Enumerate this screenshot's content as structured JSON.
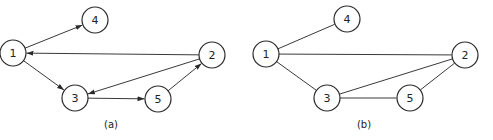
{
  "diagrams": [
    {
      "id": "a",
      "caption": "(a)",
      "caption_pos": [
        111,
        124
      ],
      "directed": true,
      "nodes": [
        {
          "label": "1",
          "x": 13,
          "y": 53
        },
        {
          "label": "2",
          "x": 212,
          "y": 55
        },
        {
          "label": "3",
          "x": 75,
          "y": 98
        },
        {
          "label": "4",
          "x": 95,
          "y": 20
        },
        {
          "label": "5",
          "x": 158,
          "y": 99
        }
      ],
      "edges": [
        {
          "from": "1",
          "to": "4"
        },
        {
          "from": "2",
          "to": "1"
        },
        {
          "from": "1",
          "to": "3"
        },
        {
          "from": "2",
          "to": "3"
        },
        {
          "from": "3",
          "to": "5"
        },
        {
          "from": "5",
          "to": "2"
        }
      ]
    },
    {
      "id": "b",
      "caption": "(b)",
      "caption_pos": [
        364,
        124
      ],
      "directed": false,
      "nodes": [
        {
          "label": "1",
          "x": 266,
          "y": 54
        },
        {
          "label": "2",
          "x": 465,
          "y": 55
        },
        {
          "label": "3",
          "x": 327,
          "y": 98
        },
        {
          "label": "4",
          "x": 347,
          "y": 19
        },
        {
          "label": "5",
          "x": 410,
          "y": 98
        }
      ],
      "edges": [
        {
          "from": "1",
          "to": "4"
        },
        {
          "from": "1",
          "to": "2"
        },
        {
          "from": "1",
          "to": "3"
        },
        {
          "from": "2",
          "to": "3"
        },
        {
          "from": "3",
          "to": "5"
        },
        {
          "from": "5",
          "to": "2"
        }
      ]
    }
  ],
  "style": {
    "node_radius": 13,
    "stroke_color": "#2a2a2a"
  }
}
